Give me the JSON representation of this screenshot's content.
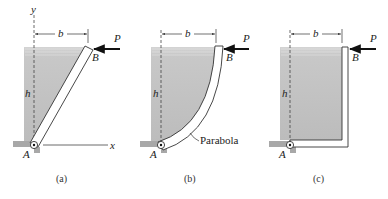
{
  "figure": {
    "panels": [
      {
        "id": "a",
        "caption": "(a)",
        "gate_shape": "straight inclined",
        "labels": {
          "y_axis": "y",
          "x_axis": "x",
          "width": "b",
          "height": "h",
          "force": "P",
          "hinge": "A",
          "tip": "B"
        }
      },
      {
        "id": "b",
        "caption": "(b)",
        "gate_shape": "parabolic",
        "labels": {
          "width": "b",
          "height": "h",
          "force": "P",
          "hinge": "A",
          "tip": "B",
          "curve": "Parabola"
        }
      },
      {
        "id": "c",
        "caption": "(c)",
        "gate_shape": "L-shaped",
        "labels": {
          "width": "b",
          "height": "h",
          "force": "P",
          "hinge": "A",
          "tip": "B"
        }
      }
    ],
    "colors": {
      "fluid": "#c4c4c4",
      "fluid_surface": "#d8d8d8",
      "gate_fill": "#ffffff",
      "stroke": "#333333",
      "force_arrow": "#111111",
      "ground": "#a8a8a8"
    }
  }
}
